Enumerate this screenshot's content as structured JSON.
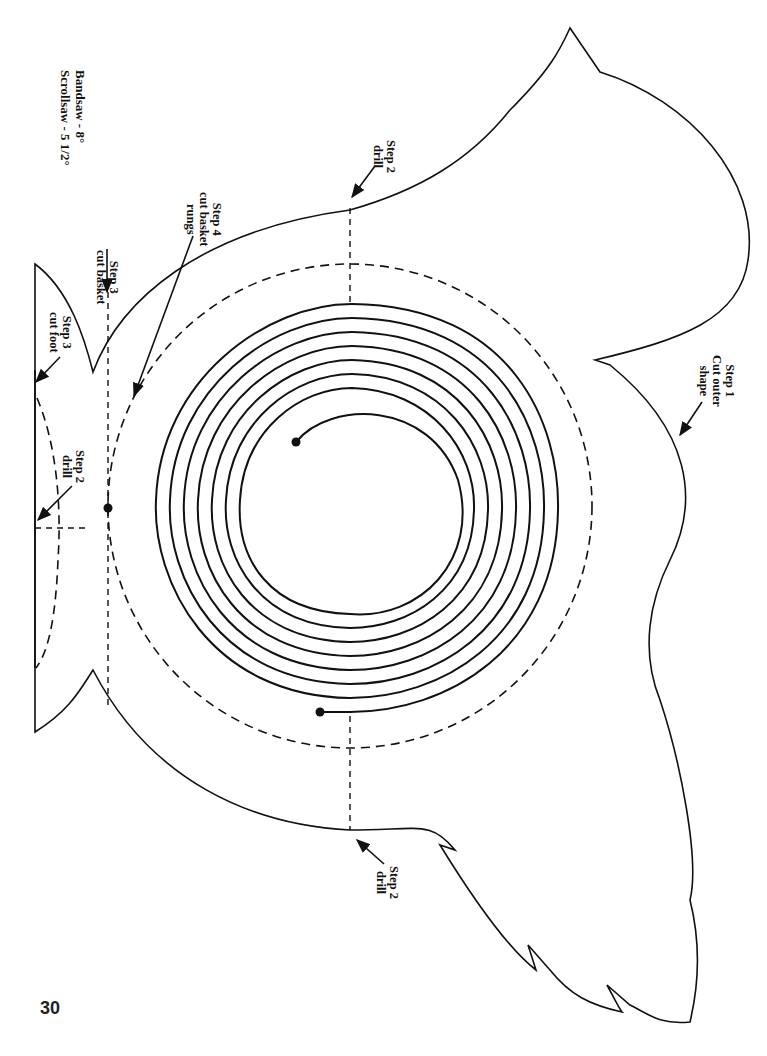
{
  "page": {
    "page_number": "30",
    "saw_angles": {
      "bandsaw": "Bandsaw - 8°",
      "scrollsaw": "Scrollsaw - 5 1/2°"
    }
  },
  "steps": {
    "step1_cut_outer": {
      "line1": "Step 1",
      "line2": "Cut outer",
      "line3": "shape"
    },
    "step2_drill_top": {
      "line1": "Step 2",
      "line2": "drill"
    },
    "step2_drill_bottom": {
      "line1": "Step 2",
      "line2": "drill"
    },
    "step2_drill_foot": {
      "line1": "Step 2",
      "line2": "drill"
    },
    "step3_cut_basket": {
      "line1": "Step 3",
      "line2": "cut basket"
    },
    "step3_cut_foot": {
      "line1": "Step 3",
      "line2": "cut foot"
    },
    "step4_cut_rungs": {
      "line1": "Step 4",
      "line2": "cut basket",
      "line3": "rungs"
    }
  },
  "pattern": {
    "spiral_center": [
      350,
      506
    ],
    "spiral_turns": 8,
    "dashed_circle_radius": 242,
    "line_color": "#111111",
    "background": "#ffffff"
  }
}
